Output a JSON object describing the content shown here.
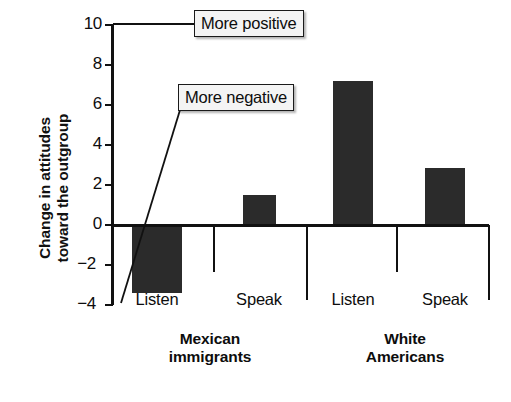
{
  "chart_data": {
    "type": "bar",
    "title": "",
    "subtitle": "",
    "xlabel": "",
    "ylabel": "Change in attitudes\ntoward the outgroup",
    "ylabel_line1": "Change in attitudes",
    "ylabel_line2": "toward the outgroup",
    "ylim": [
      -4,
      10
    ],
    "ytick_values": [
      10,
      8,
      6,
      4,
      2,
      0,
      -2,
      -4
    ],
    "ytick_labels": [
      "10",
      "8",
      "6",
      "4",
      "2",
      "0",
      "−2",
      "−4"
    ],
    "grid": false,
    "legend": "none",
    "categories": [
      "Listen",
      "Speak",
      "Listen",
      "Speak"
    ],
    "values": [
      -3.4,
      1.5,
      7.2,
      2.85
    ],
    "groups": [
      {
        "label": "Mexican\nimmigrants",
        "label_line1": "Mexican",
        "label_line2": "immigrants",
        "bars": [
          {
            "category": "Listen",
            "value": -3.4
          },
          {
            "category": "Speak",
            "value": 1.5
          }
        ]
      },
      {
        "label": "White\nAmericans",
        "label_line1": "White",
        "label_line2": "Americans",
        "bars": [
          {
            "category": "Listen",
            "value": 7.2
          },
          {
            "category": "Speak",
            "value": 2.85
          }
        ]
      }
    ],
    "annotations": [
      {
        "text": "More positive",
        "points_to": "y-axis top (10)"
      },
      {
        "text": "More negative",
        "points_to": "y-axis bottom (−4)"
      }
    ],
    "colors": {
      "bar_fill": "#2b2b2b",
      "axis": "#111111",
      "background": "#ffffff",
      "callout_fill": "#f4f4f4",
      "callout_border": "#1a1a1a"
    }
  }
}
